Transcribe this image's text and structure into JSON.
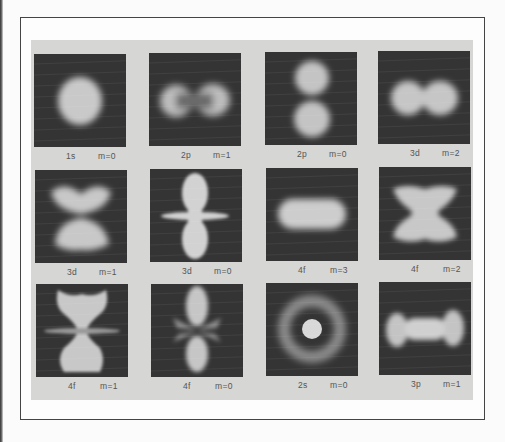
{
  "figure": {
    "plates": [
      {
        "orbital": "1s",
        "m": "m=0",
        "shape": "sphere"
      },
      {
        "orbital": "2p",
        "m": "m=1",
        "shape": "horizontal-dumbbell"
      },
      {
        "orbital": "2p",
        "m": "m=0",
        "shape": "vertical-dumbbell"
      },
      {
        "orbital": "3d",
        "m": "m=2",
        "shape": "horizontal-double-lobe"
      },
      {
        "orbital": "3d",
        "m": "m=1",
        "shape": "bowtie"
      },
      {
        "orbital": "3d",
        "m": "m=0",
        "shape": "dz2-lobes-with-ring"
      },
      {
        "orbital": "4f",
        "m": "m=3",
        "shape": "oblong"
      },
      {
        "orbital": "4f",
        "m": "m=2",
        "shape": "x-cross"
      },
      {
        "orbital": "4f",
        "m": "m=1",
        "shape": "hourglass-with-ring"
      },
      {
        "orbital": "4f",
        "m": "m=0",
        "shape": "vertical-lobes-with-cones"
      },
      {
        "orbital": "2s",
        "m": "m=0",
        "shape": "core-with-ring"
      },
      {
        "orbital": "3p",
        "m": "m=1",
        "shape": "dumbbell-with-bar"
      }
    ]
  },
  "colors": {
    "plate_background": "#343434",
    "glow": "#cfcfcf",
    "panel": "#d6d6d4",
    "caption_text": "#555555",
    "frame_line": "#444444"
  }
}
